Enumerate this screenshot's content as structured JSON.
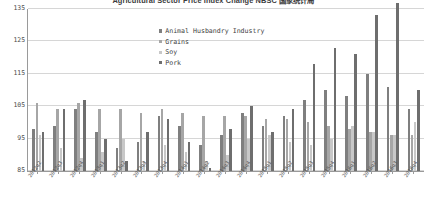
{
  "chart_data": {
    "type": "bar",
    "title": "Agricultural Sector Price Index Change NBSC 国家统计局",
    "xlabel": "",
    "ylabel": "",
    "ylim": [
      85,
      135
    ],
    "yticks": [
      85,
      95,
      105,
      115,
      125,
      135
    ],
    "grid": true,
    "legend_position": "inside-top-center",
    "categories": [
      "2012q2",
      "2012q3",
      "2012q4",
      "2013q1",
      "2013q2",
      "2013q3",
      "2013q4",
      "2014q1",
      "2014q2",
      "2014q3",
      "2014q4",
      "2015q1",
      "2015q2",
      "2015q3",
      "2015q4",
      "2016q1",
      "2016q2",
      "2016q3",
      "2016q4"
    ],
    "series": [
      {
        "name": "Animal Husbandry Industry",
        "color": "#7f7f7f",
        "values": [
          98,
          99,
          104,
          97,
          92,
          94,
          102,
          99,
          93,
          96,
          103,
          99,
          102,
          107,
          110,
          108,
          115,
          111,
          104
        ]
      },
      {
        "name": "Grains",
        "color": "#a6a6a6",
        "values": [
          106,
          104,
          106,
          104,
          104,
          103,
          104,
          103,
          102,
          102,
          102,
          101,
          101,
          100,
          99,
          98,
          97,
          96,
          96
        ]
      },
      {
        "name": "Soy",
        "color": "#c8c8c8",
        "values": [
          96,
          92,
          89,
          91,
          95,
          88,
          93,
          91,
          88,
          90,
          95,
          96,
          94,
          93,
          95,
          99,
          97,
          96,
          100
        ]
      },
      {
        "name": "Pork",
        "color": "#6e6e6e",
        "values": [
          97,
          104,
          107,
          95,
          88,
          97,
          101,
          94,
          86,
          98,
          105,
          97,
          104,
          118,
          123,
          121,
          133,
          137,
          110
        ]
      }
    ]
  }
}
